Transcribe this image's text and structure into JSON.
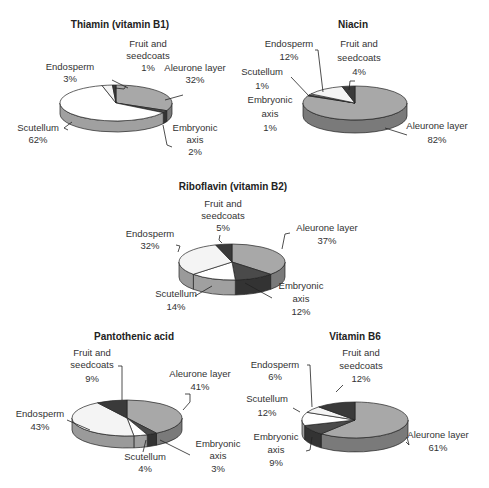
{
  "colors": {
    "aleurone": "#a8a8a8",
    "aleurone_side": "#7a7a7a",
    "embryonic": "#4a4a4a",
    "embryonic_side": "#333333",
    "scutellum": "#ffffff",
    "scutellum_side": "#a0a0a0",
    "endosperm": "#f4f4f4",
    "endosperm_side": "#9a9a9a",
    "fruit": "#3a3a3a",
    "fruit_side": "#2a2a2a",
    "outline": "#222222"
  },
  "chart_data": [
    {
      "type": "pie",
      "title": "Thiamin (vitamin B1)",
      "labels": [
        "Aleurone layer",
        "Embryonic axis",
        "Scutellum",
        "Endosperm",
        "Fruit and seedcoats"
      ],
      "values": [
        32,
        2,
        62,
        3,
        1
      ]
    },
    {
      "type": "pie",
      "title": "Niacin",
      "labels": [
        "Aleurone layer",
        "Embryonic axis",
        "Scutellum",
        "Endosperm",
        "Fruit and seedcoats"
      ],
      "values": [
        82,
        1,
        1,
        12,
        4
      ]
    },
    {
      "type": "pie",
      "title": "Riboflavin (vitamin B2)",
      "labels": [
        "Aleurone layer",
        "Embryonic axis",
        "Scutellum",
        "Endosperm",
        "Fruit and seedcoats"
      ],
      "values": [
        37,
        12,
        14,
        32,
        5
      ]
    },
    {
      "type": "pie",
      "title": "Pantothenic acid",
      "labels": [
        "Aleurone layer",
        "Embryonic axis",
        "Scutellum",
        "Endosperm",
        "Fruit and seedcoats"
      ],
      "values": [
        41,
        3,
        4,
        43,
        9
      ]
    },
    {
      "type": "pie",
      "title": "Vitamin B6",
      "labels": [
        "Aleurone layer",
        "Embryonic axis",
        "Scutellum",
        "Endosperm",
        "Fruit and seedcoats"
      ],
      "values": [
        61,
        9,
        12,
        6,
        12
      ]
    }
  ],
  "charts": [
    {
      "title": "Thiamin (vitamin B1)",
      "labels": {
        "fruit_1": "Fruit and",
        "fruit_2": "seedcoats",
        "fruit_v": "1%",
        "endo_1": "Endosperm",
        "endo_v": "3%",
        "aleu_1": "Aleurone layer",
        "aleu_v": "32%",
        "scut_1": "Scutellum",
        "scut_v": "62%",
        "emb_1": "Embryonic",
        "emb_2": "axis",
        "emb_v": "2%"
      }
    },
    {
      "title": "Niacin",
      "labels": {
        "endo_1": "Endosperm",
        "endo_v": "12%",
        "fruit_1": "Fruit and",
        "fruit_2": "seedcoats",
        "fruit_v": "4%",
        "scut_1": "Scutellum",
        "scut_v": "1%",
        "emb_1": "Embryonic",
        "emb_2": "axis",
        "emb_v": "1%",
        "aleu_1": "Aleurone layer",
        "aleu_v": "82%"
      }
    },
    {
      "title": "Riboflavin (vitamin B2)",
      "labels": {
        "fruit_1": "Fruit and",
        "fruit_2": "seedcoats",
        "fruit_v": "5%",
        "endo_1": "Endosperm",
        "endo_v": "32%",
        "aleu_1": "Aleurone layer",
        "aleu_v": "37%",
        "scut_1": "Scutellum",
        "scut_v": "14%",
        "emb_1": "Embryonic",
        "emb_2": "axis",
        "emb_v": "12%"
      }
    },
    {
      "title": "Pantothenic acid",
      "labels": {
        "fruit_1": "Fruit and",
        "fruit_2": "seedcoats",
        "fruit_v": "9%",
        "aleu_1": "Aleurone layer",
        "aleu_v": "41%",
        "endo_1": "Endosperm",
        "endo_v": "43%",
        "scut_1": "Scutellum",
        "scut_v": "4%",
        "emb_1": "Embryonic",
        "emb_2": "axis",
        "emb_v": "3%"
      }
    },
    {
      "title": "Vitamin B6",
      "labels": {
        "endo_1": "Endosperm",
        "endo_v": "6%",
        "fruit_1": "Fruit and",
        "fruit_2": "seedcoats",
        "fruit_v": "12%",
        "scut_1": "Scutellum",
        "scut_v": "12%",
        "emb_1": "Embryonic",
        "emb_2": "axis",
        "emb_v": "9%",
        "aleu_1": "Aleurone layer",
        "aleu_v": "61%"
      }
    }
  ]
}
